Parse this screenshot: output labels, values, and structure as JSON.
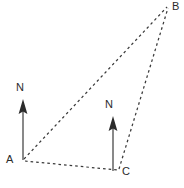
{
  "figure": {
    "kind": "bearings-triangle-diagram",
    "width": 184,
    "height": 188,
    "background_color": "#ffffff",
    "line_color": "#3a3a3a",
    "text_color": "#2b2b2b"
  },
  "labels": {
    "vertex_a": "A",
    "vertex_b": "B",
    "vertex_c": "C",
    "north_at_a": "N",
    "north_at_c": "N"
  },
  "points": {
    "a": {
      "x": 22,
      "y": 160
    },
    "b": {
      "x": 168,
      "y": 6
    },
    "c": {
      "x": 118,
      "y": 170
    }
  },
  "north_arrows": [
    {
      "name": "north-arrow-a",
      "base_x": 23,
      "base_y": 160,
      "tip_x": 23,
      "tip_y": 102,
      "label": "N"
    },
    {
      "name": "north-arrow-c",
      "base_x": 113,
      "base_y": 170,
      "tip_x": 113,
      "tip_y": 119,
      "label": "N"
    }
  ],
  "edges": [
    {
      "name": "edge-a-b",
      "from": "a",
      "to": "b",
      "style": "dashed"
    },
    {
      "name": "edge-a-c",
      "from": "a",
      "to": "c",
      "style": "dashed"
    },
    {
      "name": "edge-c-b",
      "from": "c",
      "to": "b",
      "style": "dashed"
    }
  ]
}
